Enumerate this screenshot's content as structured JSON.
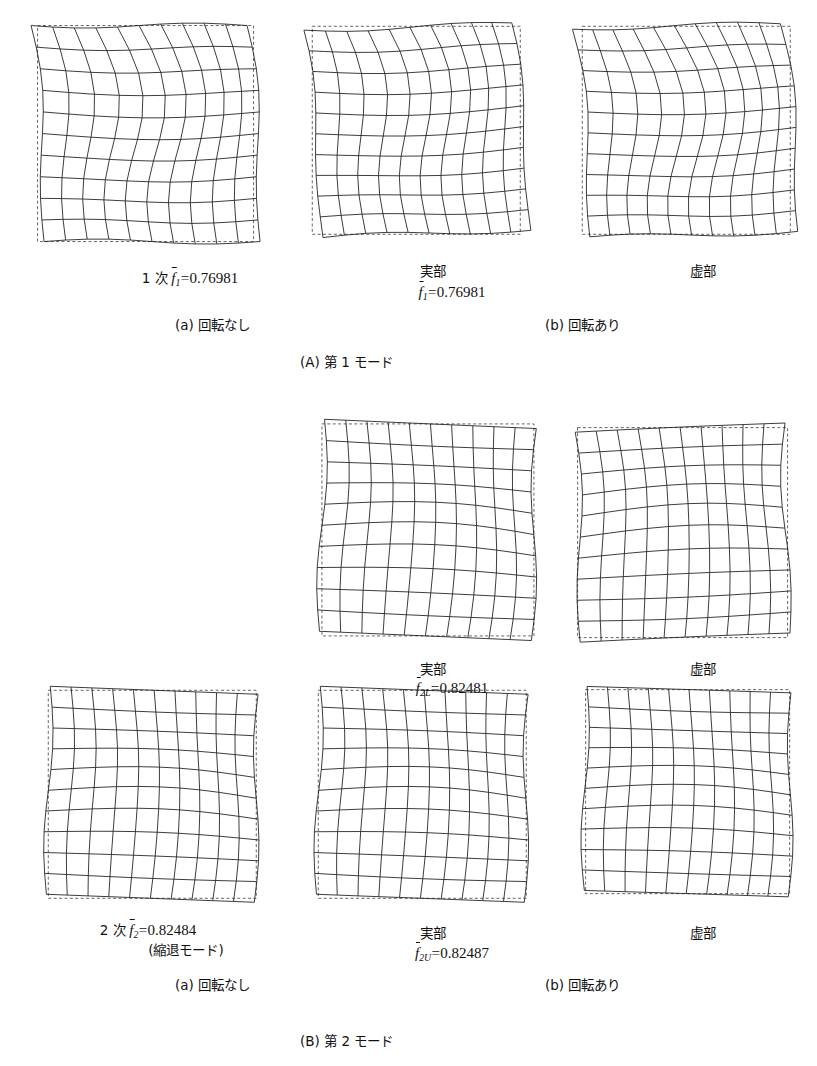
{
  "figure": {
    "background": "#ffffff",
    "line_color": "#1a1a1a",
    "dashed_color": "#555555"
  },
  "sections": [
    {
      "id": "A",
      "caption": "(A) 第 1 モード",
      "subcaption_left": "(a) 回転なし",
      "subcaption_right": "(b) 回転あり",
      "left_label_prefix": "1 次",
      "left_symbol": "f",
      "left_subscript": "1",
      "left_value": "0.76981",
      "right_symbol": "f",
      "right_subscript": "1",
      "right_value": "0.76981",
      "real_label": "実部",
      "imag_label": "虚部"
    },
    {
      "id": "B",
      "caption": "(B) 第 2 モード",
      "subcaption_left": "(a) 回転なし",
      "subcaption_right": "(b) 回転あり",
      "left_label_prefix": "2 次",
      "left_symbol": "f",
      "left_subscript": "2",
      "left_value": "0.82484",
      "left_note": "(縮退モード)",
      "upper_symbol": "f",
      "upper_subscript": "2L",
      "upper_value": "0.82481",
      "right_symbol": "f",
      "right_subscript": "2U",
      "right_value": "0.82487",
      "real_label": "実部",
      "imag_label": "虚部"
    }
  ],
  "chart_data": {
    "type": "diagram",
    "grid_divisions": 10,
    "panels": [
      {
        "name": "mode1-no-rotation",
        "row": 1,
        "column": 1,
        "x": 38,
        "y": 26,
        "size": 216,
        "mode": "torsion-s",
        "rotation_deg": 0,
        "amp_x": 0.118,
        "amp_y": 0.052,
        "phase": 0.0,
        "shear": 0.1,
        "associated_frequency": "0.76981"
      },
      {
        "name": "mode1-rotation-real",
        "row": 1,
        "column": 2,
        "x": 312,
        "y": 26,
        "size": 208,
        "mode": "torsion-s",
        "rotation_deg": -2.0,
        "amp_x": 0.112,
        "amp_y": 0.05,
        "phase": 0.05,
        "shear": 0.095,
        "associated_frequency": "0.76981"
      },
      {
        "name": "mode1-rotation-imag",
        "row": 1,
        "column": 3,
        "x": 582,
        "y": 26,
        "size": 208,
        "mode": "torsion-s",
        "rotation_deg": -1.5,
        "amp_x": 0.115,
        "amp_y": 0.05,
        "phase": -0.05,
        "shear": 0.095,
        "associated_frequency": "0.76981"
      },
      {
        "name": "mode2L-rotation-real",
        "row": 2,
        "column": 2,
        "x": 322,
        "y": 424,
        "size": 212,
        "mode": "saddle",
        "rotation_deg": 2.5,
        "amp_x": 0.07,
        "amp_y": 0.075,
        "phase": 0.0,
        "shear": 0.02,
        "associated_frequency": "0.82481"
      },
      {
        "name": "mode2L-rotation-imag",
        "row": 2,
        "column": 3,
        "x": 578,
        "y": 428,
        "size": 210,
        "mode": "saddle",
        "rotation_deg": -2.5,
        "amp_x": 0.068,
        "amp_y": 0.072,
        "phase": 0.12,
        "shear": -0.02,
        "associated_frequency": "0.82481"
      },
      {
        "name": "mode2-no-rotation",
        "row": 3,
        "column": 1,
        "x": 48,
        "y": 690,
        "size": 208,
        "mode": "saddle",
        "rotation_deg": 2.2,
        "amp_x": 0.066,
        "amp_y": 0.074,
        "phase": 0.0,
        "shear": 0.02,
        "associated_frequency": "0.82484"
      },
      {
        "name": "mode2U-rotation-real",
        "row": 3,
        "column": 2,
        "x": 318,
        "y": 690,
        "size": 208,
        "mode": "saddle",
        "rotation_deg": 2.2,
        "amp_x": 0.066,
        "amp_y": 0.074,
        "phase": 0.02,
        "shear": 0.02,
        "associated_frequency": "0.82487"
      },
      {
        "name": "mode2U-rotation-imag",
        "row": 3,
        "column": 3,
        "x": 586,
        "y": 690,
        "size": 204,
        "mode": "saddle",
        "rotation_deg": 1.8,
        "amp_x": 0.064,
        "amp_y": 0.072,
        "phase": -0.04,
        "shear": 0.018,
        "associated_frequency": "0.82487"
      }
    ]
  },
  "labels": {
    "row1": {
      "left_caption_x": 190,
      "left_caption_y": 268,
      "real_x": 420,
      "real_y": 262,
      "imag_x": 690,
      "imag_y": 262,
      "freq_x": 452,
      "freq_y": 282,
      "sub_left_x": 175,
      "sub_left_y": 316,
      "sub_right_x": 545,
      "sub_right_y": 316,
      "section_x": 300,
      "section_y": 353
    },
    "row2": {
      "real_x": 420,
      "real_y": 660,
      "imag_x": 690,
      "imag_y": 660,
      "freq_x": 452,
      "freq_y": 678
    },
    "row3": {
      "left_caption_x": 148,
      "left_caption_y": 920,
      "left_note_x": 148,
      "left_note_y": 941,
      "real_x": 420,
      "real_y": 924,
      "imag_x": 690,
      "imag_y": 924,
      "freq_x": 452,
      "freq_y": 943,
      "sub_left_x": 175,
      "sub_left_y": 976,
      "sub_right_x": 545,
      "sub_right_y": 976,
      "section_x": 300,
      "section_y": 1032
    }
  }
}
